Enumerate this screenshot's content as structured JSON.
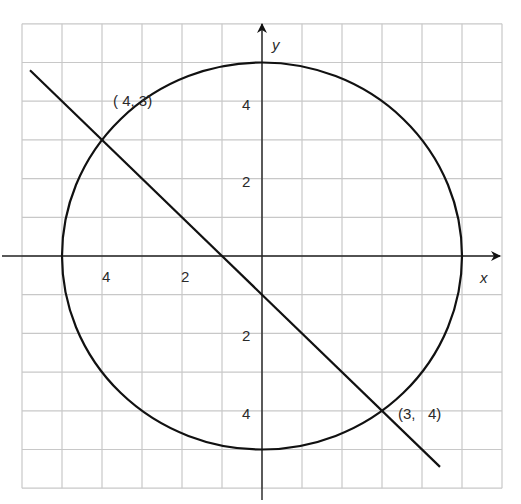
{
  "chart_data": {
    "type": "diagram",
    "title": "",
    "xlabel": "x",
    "ylabel": "y",
    "xlim": [
      -6,
      6
    ],
    "ylim": [
      -6,
      6
    ],
    "grid": true,
    "grid_step": 1,
    "x_tick_labels": [
      {
        "value": -4,
        "text": "4"
      },
      {
        "value": -2,
        "text": "2"
      }
    ],
    "y_tick_labels": [
      {
        "value": 4,
        "text": "4"
      },
      {
        "value": 2,
        "text": "2"
      },
      {
        "value": -2,
        "text": "2"
      },
      {
        "value": -4,
        "text": "4"
      }
    ],
    "circle": {
      "center": [
        0,
        0
      ],
      "radius": 5
    },
    "line": {
      "equation": "y = -x - 1",
      "from": [
        -5.8,
        4.8
      ],
      "to": [
        4.45,
        -5.45
      ]
    },
    "points": [
      {
        "x": -4,
        "y": 3,
        "label": "( 4, 3)"
      },
      {
        "x": 3,
        "y": -4,
        "label": "(3,   4)"
      }
    ]
  },
  "labels": {
    "x_axis": "x",
    "y_axis": "y",
    "point_a": "( 4, 3)",
    "point_b": "(3,   4)",
    "xtick_neg4": "4",
    "xtick_neg2": "2",
    "ytick_4": "4",
    "ytick_2": "2",
    "ytick_neg2": "2",
    "ytick_neg4": "4"
  },
  "colors": {
    "grid": "#c8c8c8",
    "axis": "#222222",
    "curve": "#111111"
  }
}
